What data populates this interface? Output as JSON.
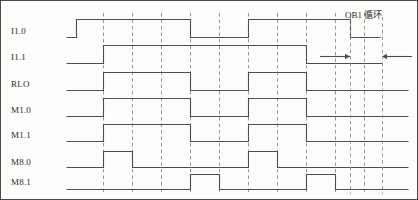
{
  "figure": {
    "kind": "plc-timing-diagram",
    "width": 418,
    "height": 200,
    "background_color": "#fdfdfb",
    "frame_color": "#4a4a4a",
    "signal_color": "#4d4d4d",
    "grid_color": "#8c8c8c",
    "text_color": "#2b2b2b"
  },
  "annotation": {
    "label": "OB1 循环",
    "x": 345,
    "y": 8
  },
  "chart_data": {
    "type": "line",
    "title": "OB1 循环",
    "xlabel": "",
    "ylabel": "",
    "grid": true,
    "legend_position": "left",
    "x_axis": {
      "plot_left": 66,
      "plot_right": 408,
      "cycle_boundaries": [
        103,
        132,
        161,
        190,
        219,
        248,
        277,
        306,
        335,
        364
      ],
      "cycle_width": 29
    },
    "signals": [
      {
        "name": "I1.0",
        "label": "I1.0",
        "label_x": 11,
        "label_y": 26,
        "baseline_y": 37,
        "high_y": 19,
        "start_x": 66,
        "end_x": 408,
        "initial_level": 0,
        "transitions": [
          {
            "x": 76,
            "level": 1
          },
          {
            "x": 190,
            "level": 0
          },
          {
            "x": 248,
            "level": 1
          },
          {
            "x": 350,
            "level": 0
          }
        ],
        "end_level": 0,
        "end_trim_x": 380
      },
      {
        "name": "I1.1",
        "label": "I1.1",
        "label_x": 11,
        "label_y": 52,
        "baseline_y": 63,
        "high_y": 45,
        "start_x": 66,
        "end_x": 408,
        "initial_level": 0,
        "transitions": [
          {
            "x": 103,
            "level": 1
          },
          {
            "x": 306,
            "level": 0
          }
        ],
        "end_level": 0,
        "end_trim_x": 382
      },
      {
        "name": "RLO",
        "label": "RLO",
        "label_x": 11,
        "label_y": 79,
        "baseline_y": 90,
        "high_y": 72,
        "start_x": 66,
        "end_x": 408,
        "initial_level": 0,
        "transitions": [
          {
            "x": 103,
            "level": 1
          },
          {
            "x": 190,
            "level": 0
          },
          {
            "x": 248,
            "level": 1
          },
          {
            "x": 306,
            "level": 0
          }
        ],
        "end_level": 0,
        "end_trim_x": 408
      },
      {
        "name": "M1.0",
        "label": "M1.0",
        "label_x": 11,
        "label_y": 105,
        "baseline_y": 116,
        "high_y": 98,
        "start_x": 66,
        "end_x": 408,
        "initial_level": 0,
        "transitions": [
          {
            "x": 103,
            "level": 1
          },
          {
            "x": 190,
            "level": 0
          },
          {
            "x": 248,
            "level": 1
          },
          {
            "x": 306,
            "level": 0
          }
        ],
        "end_level": 0,
        "end_trim_x": 408
      },
      {
        "name": "M1.1",
        "label": "M1.1",
        "label_x": 11,
        "label_y": 130,
        "baseline_y": 141,
        "high_y": 124,
        "start_x": 66,
        "end_x": 408,
        "initial_level": 0,
        "transitions": [
          {
            "x": 103,
            "level": 1
          },
          {
            "x": 190,
            "level": 0
          },
          {
            "x": 248,
            "level": 1
          },
          {
            "x": 306,
            "level": 0
          }
        ],
        "end_level": 0,
        "end_trim_x": 408
      },
      {
        "name": "M8.0",
        "label": "M8.0",
        "label_x": 11,
        "label_y": 157,
        "baseline_y": 167,
        "high_y": 151,
        "start_x": 66,
        "end_x": 408,
        "initial_level": 0,
        "transitions": [
          {
            "x": 103,
            "level": 1
          },
          {
            "x": 132,
            "level": 0
          },
          {
            "x": 248,
            "level": 1
          },
          {
            "x": 277,
            "level": 0
          }
        ],
        "end_level": 0,
        "end_trim_x": 408
      },
      {
        "name": "M8.1",
        "label": "M8.1",
        "label_x": 11,
        "label_y": 177,
        "baseline_y": 189,
        "high_y": 174,
        "start_x": 66,
        "end_x": 408,
        "initial_level": 0,
        "transitions": [
          {
            "x": 190,
            "level": 1
          },
          {
            "x": 219,
            "level": 0
          },
          {
            "x": 306,
            "level": 1
          },
          {
            "x": 335,
            "level": 0
          }
        ],
        "end_level": 0,
        "end_trim_x": 408
      }
    ],
    "cycle_markers": {
      "row_y": 56,
      "left_arrow": {
        "from_x": 320,
        "to_x": 350,
        "direction": "right"
      },
      "right_arrow": {
        "from_x": 412,
        "to_x": 382,
        "direction": "left"
      },
      "span_lines": [
        350,
        382
      ]
    }
  }
}
